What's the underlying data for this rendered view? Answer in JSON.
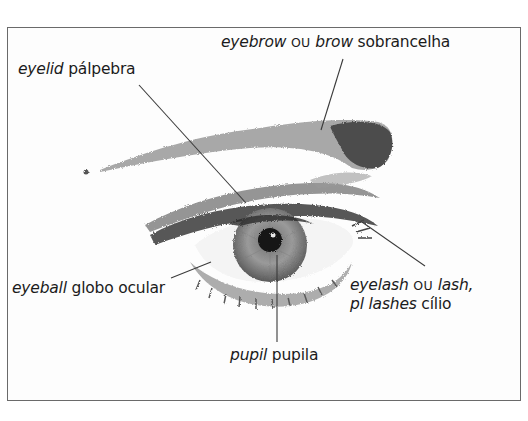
{
  "diagram": {
    "subject": "eye",
    "labels": [
      {
        "id": "eyebrow",
        "term": "eyebrow",
        "connector": "OU",
        "alt_term": "brow",
        "translation": "sobrancelha",
        "position": {
          "x": 221,
          "y": 33
        },
        "leader": {
          "x1": 343,
          "y1": 59,
          "x2": 321,
          "y2": 130
        }
      },
      {
        "id": "eyelid",
        "term": "eyelid",
        "translation": "pálpebra",
        "position": {
          "x": 18,
          "y": 60
        },
        "leader": {
          "x1": 139,
          "y1": 85,
          "x2": 246,
          "y2": 203
        }
      },
      {
        "id": "eyeball",
        "term": "eyeball",
        "translation": "globo ocular",
        "position": {
          "x": 12,
          "y": 279
        },
        "leader": {
          "x1": 171,
          "y1": 278,
          "x2": 211,
          "y2": 262
        }
      },
      {
        "id": "eyelash",
        "term": "eyelash",
        "connector": "OU",
        "alt_term": "lash,",
        "plural_prefix": "pl",
        "plural_term": "lashes",
        "translation": "cílio",
        "position": {
          "x": 350,
          "y": 276
        },
        "leader": {
          "x1": 362,
          "y1": 222,
          "x2": 425,
          "y2": 266
        }
      },
      {
        "id": "pupil",
        "term": "pupil",
        "translation": "pupila",
        "position": {
          "x": 230,
          "y": 346
        },
        "leader": {
          "x1": 277,
          "y1": 255,
          "x2": 277,
          "y2": 342
        }
      }
    ],
    "colors": {
      "frame": "#6a6a6a",
      "leader_line": "#3a3a3a",
      "text": "#1b1b1b",
      "background": "#ffffff"
    }
  }
}
